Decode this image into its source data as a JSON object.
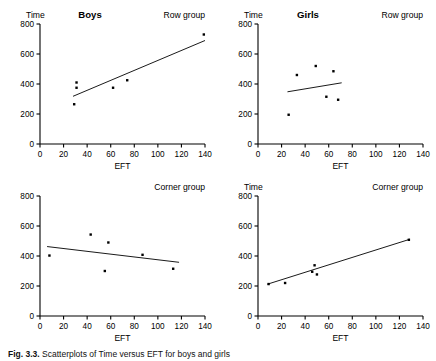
{
  "figure": {
    "caption_prefix": "Fig. 3.3.",
    "caption_text": "Scatterplots of Time versus EFT for boys and girls"
  },
  "axis": {
    "xlabel": "EFT",
    "ylabel": "Time",
    "xticks": [
      0,
      20,
      40,
      60,
      80,
      100,
      120,
      140
    ],
    "yticks": [
      0,
      200,
      400,
      600,
      800
    ],
    "xlim": [
      0,
      140
    ],
    "ylim": [
      0,
      800
    ]
  },
  "chart_data": [
    {
      "type": "scatter",
      "panel": "top-left",
      "title": "Boys",
      "group_label": "Row group",
      "xlabel": "EFT",
      "ylabel": "Time",
      "xlim": [
        0,
        140
      ],
      "ylim": [
        0,
        800
      ],
      "xticks": [
        0,
        20,
        40,
        60,
        80,
        100,
        120,
        140
      ],
      "yticks": [
        0,
        200,
        400,
        600,
        800
      ],
      "grid": false,
      "legend": "none",
      "points": [
        {
          "x": 29,
          "y": 265
        },
        {
          "x": 31,
          "y": 375
        },
        {
          "x": 31,
          "y": 410
        },
        {
          "x": 62,
          "y": 375
        },
        {
          "x": 74,
          "y": 425
        },
        {
          "x": 139,
          "y": 730
        }
      ],
      "fit_line": {
        "x1": 28,
        "y1": 318,
        "x2": 140,
        "y2": 690
      }
    },
    {
      "type": "scatter",
      "panel": "top-right",
      "title": "Girls",
      "group_label": "Row group",
      "xlabel": "EFT",
      "ylabel": "Time",
      "xlim": [
        0,
        140
      ],
      "ylim": [
        0,
        800
      ],
      "xticks": [
        0,
        20,
        40,
        60,
        80,
        100,
        120,
        140
      ],
      "yticks": [
        0,
        200,
        400,
        600,
        800
      ],
      "grid": false,
      "legend": "none",
      "points": [
        {
          "x": 26,
          "y": 195
        },
        {
          "x": 33,
          "y": 460
        },
        {
          "x": 49,
          "y": 520
        },
        {
          "x": 58,
          "y": 315
        },
        {
          "x": 64,
          "y": 485
        },
        {
          "x": 68,
          "y": 295
        }
      ],
      "fit_line": {
        "x1": 25,
        "y1": 348,
        "x2": 71,
        "y2": 408
      }
    },
    {
      "type": "scatter",
      "panel": "bottom-left",
      "title": "Boys",
      "group_label": "Corner group",
      "xlabel": "EFT",
      "ylabel": "Time",
      "xlim": [
        0,
        140
      ],
      "ylim": [
        0,
        800
      ],
      "xticks": [
        0,
        20,
        40,
        60,
        80,
        100,
        120,
        140
      ],
      "yticks": [
        0,
        200,
        400,
        600,
        800
      ],
      "grid": false,
      "legend": "none",
      "points": [
        {
          "x": 8,
          "y": 403
        },
        {
          "x": 43,
          "y": 543
        },
        {
          "x": 55,
          "y": 300
        },
        {
          "x": 58,
          "y": 490
        },
        {
          "x": 87,
          "y": 408
        },
        {
          "x": 113,
          "y": 315
        }
      ],
      "fit_line": {
        "x1": 6,
        "y1": 463,
        "x2": 118,
        "y2": 358
      }
    },
    {
      "type": "scatter",
      "panel": "bottom-right",
      "title": "Girls",
      "group_label": "Corner group",
      "xlabel": "EFT",
      "ylabel": "Time",
      "xlim": [
        0,
        140
      ],
      "ylim": [
        0,
        800
      ],
      "xticks": [
        0,
        20,
        40,
        60,
        80,
        100,
        120,
        140
      ],
      "yticks": [
        0,
        200,
        400,
        600,
        800
      ],
      "grid": false,
      "legend": "none",
      "points": [
        {
          "x": 9,
          "y": 213
        },
        {
          "x": 23,
          "y": 220
        },
        {
          "x": 46,
          "y": 295
        },
        {
          "x": 48,
          "y": 338
        },
        {
          "x": 50,
          "y": 277
        },
        {
          "x": 128,
          "y": 508
        }
      ],
      "fit_line": {
        "x1": 8,
        "y1": 212,
        "x2": 129,
        "y2": 512
      }
    }
  ]
}
